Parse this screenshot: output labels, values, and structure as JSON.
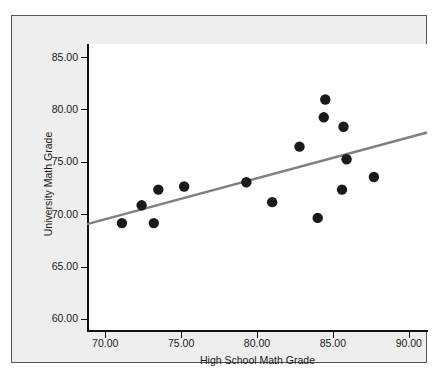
{
  "chart_data": {
    "type": "scatter",
    "title": "",
    "xlabel": "High School Math Grade",
    "ylabel": "University Math Grade",
    "xlim": [
      68.8,
      91.2
    ],
    "ylim": [
      58.9,
      86.3
    ],
    "xticks": [
      "70.00",
      "75.00",
      "80.00",
      "85.00",
      "90.00"
    ],
    "xtick_values": [
      70,
      75,
      80,
      85,
      90
    ],
    "yticks": [
      "60.00",
      "65.00",
      "70.00",
      "75.00",
      "80.00",
      "85.00"
    ],
    "ytick_values": [
      60,
      65,
      70,
      75,
      80,
      85
    ],
    "grid": false,
    "legend": "none",
    "points": [
      {
        "x": 71.1,
        "y": 69.2
      },
      {
        "x": 72.4,
        "y": 70.9
      },
      {
        "x": 73.2,
        "y": 69.2
      },
      {
        "x": 73.5,
        "y": 72.4
      },
      {
        "x": 75.2,
        "y": 72.7
      },
      {
        "x": 79.3,
        "y": 73.1
      },
      {
        "x": 81.0,
        "y": 71.2
      },
      {
        "x": 82.8,
        "y": 76.5
      },
      {
        "x": 84.0,
        "y": 69.7
      },
      {
        "x": 84.4,
        "y": 79.3
      },
      {
        "x": 84.5,
        "y": 81.0
      },
      {
        "x": 85.6,
        "y": 72.4
      },
      {
        "x": 85.7,
        "y": 78.4
      },
      {
        "x": 85.9,
        "y": 75.3
      },
      {
        "x": 87.7,
        "y": 73.6
      }
    ],
    "fit_line": {
      "name": "linear-fit",
      "color": "#808080",
      "x_start": 68.8,
      "y_start": 69.1,
      "x_end": 91.2,
      "y_end": 77.85
    },
    "marker": {
      "shape": "circle",
      "color": "#1a1a1a",
      "radius_px": 5.2
    },
    "colors": {
      "panel_background": "#eeeeee",
      "plot_background": "#ffffff",
      "axis": "#111111",
      "text": "#1a1a1a",
      "border": "#555555"
    }
  }
}
